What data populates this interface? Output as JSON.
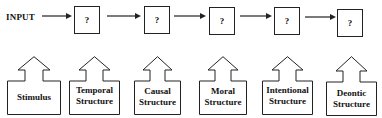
{
  "diagram": {
    "input_label": "INPUT",
    "stages": [
      {
        "label": "?"
      },
      {
        "label": "?"
      },
      {
        "label": "?"
      },
      {
        "label": "?"
      },
      {
        "label": "?"
      }
    ],
    "structures": [
      {
        "line1": "Stimulus",
        "line2": ""
      },
      {
        "line1": "Temporal",
        "line2": "Structure"
      },
      {
        "line1": "Causal",
        "line2": "Structure"
      },
      {
        "line1": "Moral",
        "line2": "Structure"
      },
      {
        "line1": "Intentional",
        "line2": "Structure"
      },
      {
        "line1": "Deontic",
        "line2": "Structure"
      }
    ],
    "colors": {
      "stroke": "#222222",
      "background": "#ffffff"
    }
  }
}
